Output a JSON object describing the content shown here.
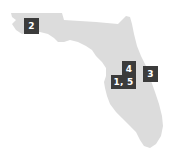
{
  "map": {
    "region": "Florida",
    "fill_color": "#dcdcdc",
    "marker_color": "#3b3b3b",
    "marker_text_color": "#ffffff",
    "markers": [
      {
        "label": "2",
        "x": 24,
        "y": 18,
        "w": 15,
        "h": 16
      },
      {
        "label": "4",
        "x": 122,
        "y": 61,
        "w": 14,
        "h": 15
      },
      {
        "label": "3",
        "x": 143,
        "y": 66,
        "w": 15,
        "h": 16
      },
      {
        "label": "1, 5",
        "x": 111,
        "y": 75,
        "w": 25,
        "h": 14
      }
    ]
  }
}
